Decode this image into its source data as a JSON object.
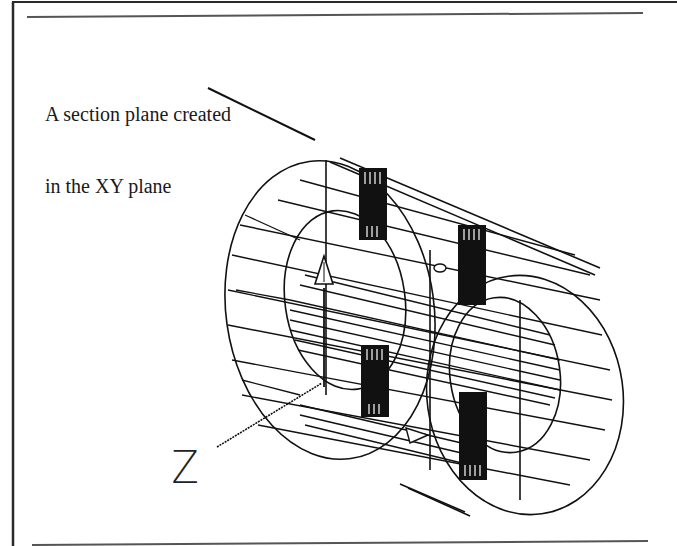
{
  "figure": {
    "callout": {
      "line1": "A section plane created",
      "line2": "in the XY plane"
    },
    "axis_label": "Z",
    "colors": {
      "ink": "#111111",
      "border": "#333333",
      "rule": "#555555",
      "background": "#ffffff"
    },
    "elements": {
      "outer_cylinder": "wireframe-cylinder",
      "inner_bore": "wireframe-bore",
      "pins": [
        "pin-top-left",
        "pin-top-right",
        "pin-bottom-left",
        "pin-bottom-right"
      ],
      "axis_arrow": "y-axis-arrow",
      "ucs_icon": "ucs-icon"
    }
  }
}
